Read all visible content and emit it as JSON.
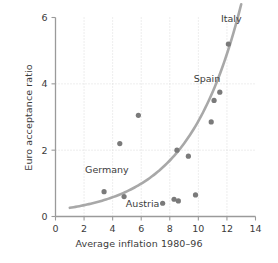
{
  "chart_data": {
    "type": "scatter",
    "title": "",
    "xlabel": "Average inflation 1980–96",
    "ylabel": "Euro acceptance ratio",
    "xlim": [
      0,
      14
    ],
    "ylim": [
      0,
      6
    ],
    "xticks": [
      0,
      2,
      4,
      6,
      8,
      10,
      12,
      14
    ],
    "yticks": [
      0,
      2,
      4,
      6
    ],
    "xtick_labels": [
      "0",
      "2",
      "4",
      "6",
      "8",
      "10",
      "12",
      "14"
    ],
    "ytick_labels": [
      "0",
      "2",
      "4",
      "6"
    ],
    "grid": true,
    "grid_style": "dotted",
    "legend": "none",
    "point_color": "#7a7a7a",
    "curve_color": "#a8a8a8",
    "axis_color": "#9a9a9a",
    "grid_color": "#d8d8d8",
    "text_color": "#3b3b3b",
    "points": [
      {
        "x": 3.4,
        "y": 0.75,
        "label": "Germany"
      },
      {
        "x": 4.5,
        "y": 2.2,
        "label": ""
      },
      {
        "x": 4.8,
        "y": 0.6,
        "label": "Austria"
      },
      {
        "x": 5.8,
        "y": 3.05,
        "label": ""
      },
      {
        "x": 7.5,
        "y": 0.4,
        "label": ""
      },
      {
        "x": 8.3,
        "y": 0.52,
        "label": ""
      },
      {
        "x": 8.6,
        "y": 0.47,
        "label": ""
      },
      {
        "x": 8.5,
        "y": 2.0,
        "label": ""
      },
      {
        "x": 9.3,
        "y": 1.82,
        "label": ""
      },
      {
        "x": 9.8,
        "y": 0.65,
        "label": ""
      },
      {
        "x": 10.9,
        "y": 2.85,
        "label": ""
      },
      {
        "x": 11.1,
        "y": 3.5,
        "label": ""
      },
      {
        "x": 11.5,
        "y": 3.75,
        "label": "Spain"
      },
      {
        "x": 12.1,
        "y": 5.2,
        "label": "Italy"
      }
    ],
    "fit_curve": {
      "description": "exponential trend line",
      "x_start": 1.0,
      "x_end": 13.0,
      "a": 0.2,
      "b": 0.2666
    },
    "annotations": [
      {
        "text": "Italy",
        "x": 12.3,
        "y": 5.85,
        "anchor": "middle"
      },
      {
        "text": "Spain",
        "x": 10.6,
        "y": 4.05,
        "anchor": "middle"
      },
      {
        "text": "Germany",
        "x": 3.6,
        "y": 1.3,
        "anchor": "middle"
      },
      {
        "text": "Austria",
        "x": 6.1,
        "y": 0.28,
        "anchor": "middle"
      }
    ]
  }
}
